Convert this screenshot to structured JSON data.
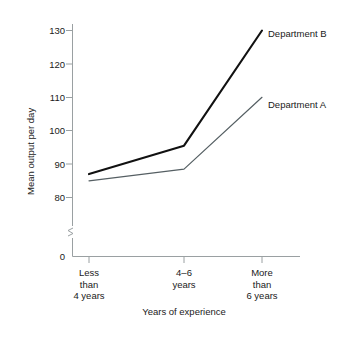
{
  "chart_data": {
    "type": "line",
    "title": "",
    "xlabel": "Years of experience",
    "ylabel": "Mean output per day",
    "categories": [
      "Less\nthan\n4 years",
      "4–6\nyears",
      "More\nthan\n6 years"
    ],
    "series": [
      {
        "name": "Department B",
        "values": [
          87,
          95.5,
          130
        ],
        "color": "#111111",
        "width": 2.1
      },
      {
        "name": "Department A",
        "values": [
          85,
          88.5,
          110
        ],
        "color": "#555f63",
        "width": 1.2
      }
    ],
    "yticks": [
      0,
      80,
      90,
      100,
      110,
      120,
      130
    ],
    "ytick_labels": [
      "0",
      "80",
      "90",
      "100",
      "110",
      "120",
      "130"
    ],
    "ylim": [
      80,
      130
    ],
    "axis_break": true,
    "grid": false,
    "legend": "inline-right-of-series-end",
    "axis_color": "#9aa0a2",
    "text_color": "#1a1a1a"
  },
  "labels": {
    "y_axis_title": "Mean output per day",
    "x_axis_title": "Years of experience",
    "ytick_130": "130",
    "ytick_120": "120",
    "ytick_110": "110",
    "ytick_100": "100",
    "ytick_90": "90",
    "ytick_80": "80",
    "ytick_0": "0",
    "cat_1": "Less\nthan\n4 years",
    "cat_2": "4–6\nyears",
    "cat_3": "More\nthan\n6 years",
    "series_b": "Department B",
    "series_a": "Department A"
  }
}
